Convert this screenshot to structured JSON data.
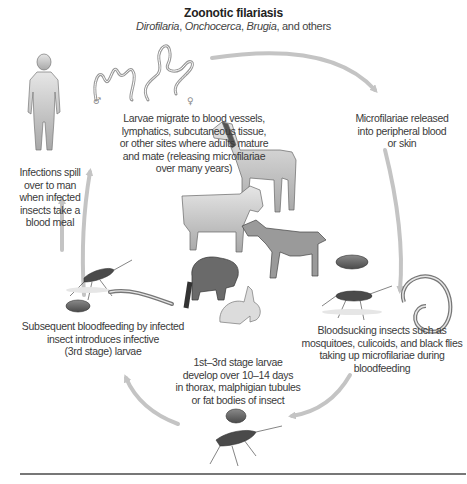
{
  "header": {
    "title": "Zoonotic filariasis",
    "subtitle_genera": [
      "Dirofilaria",
      "Onchocerca",
      "Brugia"
    ],
    "subtitle_sep1": ", ",
    "subtitle_sep2": ", ",
    "subtitle_tail": ", and others"
  },
  "steps": [
    {
      "id": "migrate",
      "text_lines": [
        "Larvae migrate to blood vessels,",
        "lymphatics, subcutaneous tissue,",
        "or other sites where adults mature",
        "and mate (releasing microfilariae",
        "over many years)"
      ]
    },
    {
      "id": "release",
      "text_lines": [
        "Microfilariae released",
        "into peripheral blood",
        "or skin"
      ]
    },
    {
      "id": "uptake",
      "text_lines": [
        "Bloodsucking insects such as",
        "mosquitoes, culicoids, and black flies",
        "taking up microfilariae during",
        "bloodfeeding"
      ]
    },
    {
      "id": "develop",
      "text_lines": [
        "1st–3rd stage larvae",
        "develop over 10–14 days",
        "in thorax, malphigian tubules",
        "or fat bodies of insect"
      ]
    },
    {
      "id": "transmit",
      "text_lines": [
        "Subsequent bloodfeeding by infected",
        "insect introduces infective",
        "(3rd stage) larvae"
      ]
    },
    {
      "id": "spill",
      "text_lines": [
        "Infections spill",
        "over to man",
        "when infected",
        "insects take a",
        "blood meal"
      ]
    }
  ],
  "symbols": {
    "male": "♂",
    "female": "♀"
  },
  "illustrations": [
    "human",
    "adult-worms",
    "horse",
    "cow",
    "dog",
    "raccoon",
    "rabbit",
    "mosquito",
    "black-fly",
    "microfilaria",
    "larva"
  ],
  "colors": {
    "arrow": "#c4c4c4",
    "text": "#3a3a3a",
    "rule": "#777777",
    "animal_fill": "#b8b8b8",
    "insect_dark": "#3b3b3b"
  }
}
